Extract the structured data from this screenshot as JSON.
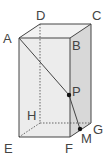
{
  "diagram": {
    "type": "rectangular prism",
    "vertices": {
      "A": {
        "label": "A",
        "x": 19,
        "y": 38
      },
      "B": {
        "label": "B",
        "x": 70,
        "y": 38
      },
      "C": {
        "label": "C",
        "x": 91,
        "y": 24
      },
      "D": {
        "label": "D",
        "x": 40,
        "y": 24
      },
      "E": {
        "label": "E",
        "x": 19,
        "y": 137
      },
      "F": {
        "label": "F",
        "x": 70,
        "y": 137
      },
      "G": {
        "label": "G",
        "x": 91,
        "y": 123
      },
      "H": {
        "label": "H",
        "x": 40,
        "y": 123
      }
    },
    "points": {
      "P": {
        "label": "P",
        "x": 69,
        "y": 95,
        "on_edge": "BF"
      },
      "M": {
        "label": "M",
        "x": 80,
        "y": 129,
        "on_edge": "FG"
      }
    },
    "segments": [
      "A-P",
      "P-M"
    ],
    "hidden_edges": [
      "D-H",
      "H-E",
      "H-G"
    ],
    "colors": {
      "edge": "#444444",
      "face_fill": "#e6e6e6",
      "side_fill": "#d4d4d4"
    }
  }
}
